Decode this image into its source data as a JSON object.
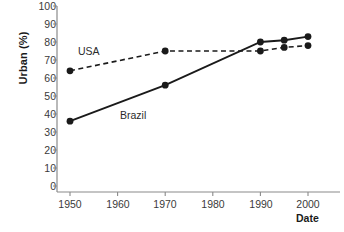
{
  "chart_data": {
    "type": "line",
    "title": "",
    "xlabel": "Date",
    "ylabel": "Urban (%)",
    "xlim": [
      1945,
      2005
    ],
    "ylim": [
      0,
      100
    ],
    "grid": false,
    "legend_position": "inline-annotation",
    "xticks": [
      1950,
      1960,
      1970,
      1980,
      1990,
      2000
    ],
    "yticks": [
      0,
      10,
      20,
      30,
      40,
      50,
      60,
      70,
      80,
      90,
      100
    ],
    "series": [
      {
        "name": "USA",
        "style": "dashed",
        "color": "#1a1a1a",
        "marker": "filled-circle",
        "x": [
          1950,
          1970,
          1990,
          1995,
          2000
        ],
        "values": [
          64,
          75,
          75,
          77,
          78
        ]
      },
      {
        "name": "Brazil",
        "style": "solid",
        "color": "#1a1a1a",
        "marker": "filled-circle",
        "x": [
          1950,
          1970,
          1990,
          1995,
          2000
        ],
        "values": [
          36,
          56,
          80,
          81,
          83
        ]
      }
    ],
    "annotations": [
      {
        "text": "USA",
        "x": 1956,
        "y": 79
      },
      {
        "text": "Brazil",
        "x": 1965,
        "y": 43
      }
    ]
  },
  "axes": {
    "y_title": "Urban (%)",
    "x_title": "Date",
    "y_tick_labels": [
      "100",
      "90",
      "80",
      "70",
      "60",
      "50",
      "40",
      "30",
      "20",
      "10",
      "0"
    ],
    "x_tick_labels": [
      "1950",
      "1960",
      "1970",
      "1980",
      "1990",
      "2000"
    ]
  },
  "labels": {
    "usa": "USA",
    "brazil": "Brazil"
  },
  "footer": {
    "cropped_caption": ""
  }
}
